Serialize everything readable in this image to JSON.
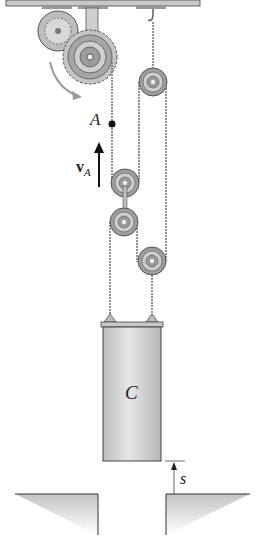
{
  "diagram": {
    "type": "pulley system",
    "labels": {
      "point_a": "A",
      "velocity": "v",
      "velocity_sub": "A",
      "block": "C",
      "displacement": "s"
    },
    "components": [
      "ceiling",
      "gear drive motor",
      "drive pulley",
      "hook",
      "fixed pulley",
      "movable pulley 1",
      "movable pulley 2",
      "movable pulley 3",
      "cable",
      "block C",
      "ground opening"
    ],
    "colors": {
      "ceiling": "#c8c8c8",
      "metal": "#a8a8a8",
      "cable": "#777777",
      "block": "#d4d4d4",
      "ground_shade": "#cfcfcf",
      "rotation_arrow": "#999999"
    }
  }
}
